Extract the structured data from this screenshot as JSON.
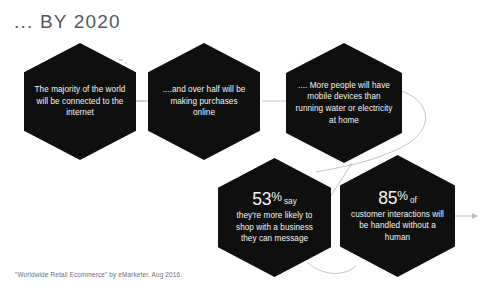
{
  "header": {
    "title": "... BY 2020"
  },
  "hexagons": [
    {
      "id": "hex-1",
      "name": "hexagon-internet-majority",
      "text": "The majority of the world will be connected to the internet",
      "stat": null,
      "stat_suffix": null,
      "fill": "#100f0f",
      "text_color": "#f4f4f4"
    },
    {
      "id": "hex-2",
      "name": "hexagon-online-purchases",
      "text": "....and over half will be making purchases online",
      "stat": null,
      "stat_suffix": null,
      "fill": "#100f0f",
      "text_color": "#f4f4f4"
    },
    {
      "id": "hex-3",
      "name": "hexagon-mobile-devices",
      "text": ".... More people will have mobile devices than running water or electricity at home",
      "stat": null,
      "stat_suffix": null,
      "fill": "#100f0f",
      "text_color": "#f4f4f4"
    },
    {
      "id": "hex-4",
      "name": "hexagon-message-business",
      "text": "they're more likely to shop with a business they can message",
      "stat": "53",
      "stat_pct": "%",
      "stat_suffix": "say",
      "fill": "#100f0f",
      "text_color": "#f4f4f4"
    },
    {
      "id": "hex-5",
      "name": "hexagon-interactions-no-human",
      "text": "customer interactions will be handled without a human",
      "stat": "85",
      "stat_pct": "%",
      "stat_suffix": "of",
      "fill": "#100f0f",
      "text_color": "#f4f4f4"
    }
  ],
  "footer": {
    "source": "\"Worldwide Retail Ecommerce\" by eMarketer, Aug 2016."
  },
  "style": {
    "background": "#ffffff",
    "title_color": "#55585a",
    "connector_color": "#b9bcbe",
    "source_color": "#6d7072"
  }
}
